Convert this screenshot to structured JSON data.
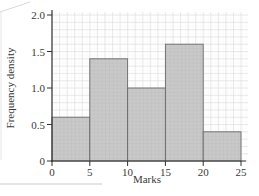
{
  "chart_data": {
    "type": "bar",
    "subtype": "histogram",
    "title": "",
    "xlabel": "Marks",
    "ylabel": "Frequency density",
    "bins": [
      [
        0,
        5
      ],
      [
        5,
        10
      ],
      [
        10,
        15
      ],
      [
        15,
        20
      ],
      [
        20,
        25
      ]
    ],
    "categories": [
      "0-5",
      "5-10",
      "10-15",
      "15-20",
      "20-25"
    ],
    "values": [
      0.6,
      1.4,
      1.0,
      1.6,
      0.4
    ],
    "xlim": [
      0,
      25
    ],
    "ylim": [
      0,
      2.0
    ],
    "xticks": [
      "0",
      "5",
      "10",
      "15",
      "20",
      "25"
    ],
    "yticks": [
      "0",
      "0.5",
      "1.0",
      "1.5",
      "2.0"
    ],
    "grid": true,
    "legend": null,
    "colors": {
      "bar_fill": "#c8c8c8",
      "bar_stroke": "#6a6a6a",
      "grid": "#e4e4e4",
      "axis": "#333333"
    }
  }
}
